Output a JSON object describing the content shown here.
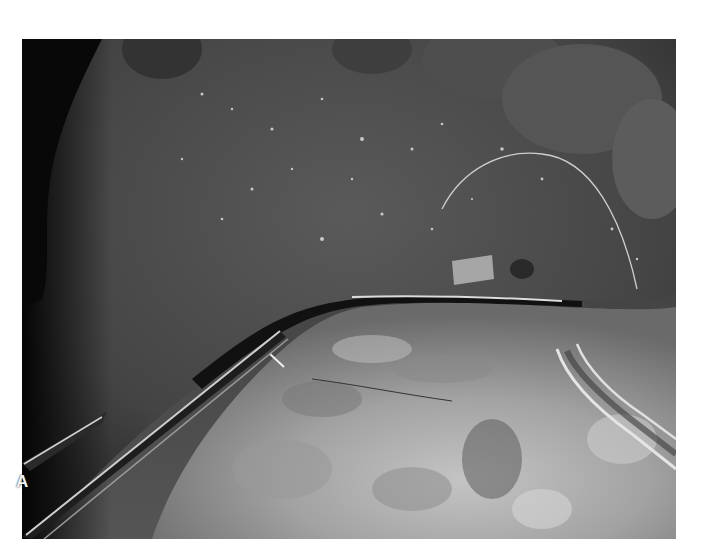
{
  "figure": {
    "panel_label": "A"
  },
  "colors": {
    "background": "#ffffff",
    "dark_tissue": "#3c3c3c",
    "light_tissue": "#a8a8a8",
    "shadow": "#0e0e0e",
    "instrument_highlight": "#e0e0e0",
    "label": "#f2f2f2"
  }
}
